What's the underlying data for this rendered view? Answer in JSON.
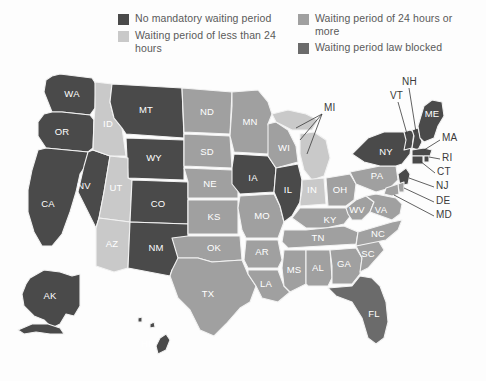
{
  "legend": {
    "columns": [
      {
        "items": [
          {
            "label": "No mandatory waiting period",
            "color": "#4a4a4a",
            "key": "none"
          },
          {
            "label": "Waiting period of less than 24 hours",
            "color": "#c9c9c9",
            "key": "lt24"
          }
        ]
      },
      {
        "items": [
          {
            "label": "Waiting period of 24 hours or more",
            "color": "#a0a0a0",
            "key": "ge24"
          },
          {
            "label": "Waiting period law blocked",
            "color": "#6b6b6b",
            "key": "blocked"
          }
        ]
      }
    ]
  },
  "colors": {
    "none": "#4a4a4a",
    "lt24": "#c9c9c9",
    "ge24": "#a0a0a0",
    "blocked": "#6b6b6b",
    "background": "#fdfdfd",
    "border": "#f2f2f2",
    "inside_label": "#ffffff",
    "outside_label": "#3a3a3a"
  },
  "map": {
    "title": "United States waiting period laws by state",
    "inside_labels": [
      {
        "code": "WA",
        "x": 72,
        "y": 37,
        "category": "none"
      },
      {
        "code": "OR",
        "x": 58,
        "y": 70,
        "category": "none"
      },
      {
        "code": "CA",
        "x": 44,
        "y": 145,
        "category": "none"
      },
      {
        "code": "NV",
        "x": 80,
        "y": 128,
        "category": "none"
      },
      {
        "code": "ID",
        "x": 100,
        "y": 85,
        "category": "lt24"
      },
      {
        "code": "MT",
        "x": 148,
        "y": 52,
        "category": "none"
      },
      {
        "code": "WY",
        "x": 153,
        "y": 98,
        "category": "none"
      },
      {
        "code": "UT",
        "x": 114,
        "y": 128,
        "category": "lt24"
      },
      {
        "code": "AZ",
        "x": 112,
        "y": 184,
        "category": "lt24"
      },
      {
        "code": "CO",
        "x": 158,
        "y": 145,
        "category": "none"
      },
      {
        "code": "NM",
        "x": 152,
        "y": 196,
        "category": "none"
      },
      {
        "code": "ND",
        "x": 207,
        "y": 57,
        "category": "ge24"
      },
      {
        "code": "SD",
        "x": 207,
        "y": 90,
        "category": "ge24"
      },
      {
        "code": "NE",
        "x": 210,
        "y": 123,
        "category": "ge24"
      },
      {
        "code": "KS",
        "x": 214,
        "y": 155,
        "category": "ge24"
      },
      {
        "code": "OK",
        "x": 218,
        "y": 186,
        "category": "ge24"
      },
      {
        "code": "TX",
        "x": 208,
        "y": 234,
        "category": "ge24"
      },
      {
        "code": "MN",
        "x": 250,
        "y": 65,
        "category": "ge24"
      },
      {
        "code": "IA",
        "x": 251,
        "y": 118,
        "category": "none"
      },
      {
        "code": "MO",
        "x": 262,
        "y": 152,
        "category": "ge24"
      },
      {
        "code": "AR",
        "x": 262,
        "y": 187,
        "category": "ge24"
      },
      {
        "code": "LA",
        "x": 268,
        "y": 225,
        "category": "ge24"
      },
      {
        "code": "WI",
        "x": 283,
        "y": 84,
        "category": "ge24"
      },
      {
        "code": "IL",
        "x": 287,
        "y": 128,
        "category": "none"
      },
      {
        "code": "MS",
        "x": 294,
        "y": 208,
        "category": "ge24"
      },
      {
        "code": "IN",
        "x": 312,
        "y": 126,
        "category": "lt24"
      },
      {
        "code": "KY",
        "x": 329,
        "y": 155,
        "category": "ge24"
      },
      {
        "code": "TN",
        "x": 318,
        "y": 178,
        "category": "ge24"
      },
      {
        "code": "AL",
        "x": 317,
        "y": 210,
        "category": "ge24"
      },
      {
        "code": "GA",
        "x": 344,
        "y": 205,
        "category": "ge24"
      },
      {
        "code": "OH",
        "x": 339,
        "y": 123,
        "category": "ge24"
      },
      {
        "code": "WV",
        "x": 355,
        "y": 145,
        "category": "ge24"
      },
      {
        "code": "VA",
        "x": 377,
        "y": 150,
        "category": "ge24"
      },
      {
        "code": "NC",
        "x": 376,
        "y": 177,
        "category": "ge24"
      },
      {
        "code": "SC",
        "x": 368,
        "y": 196,
        "category": "ge24"
      },
      {
        "code": "PA",
        "x": 379,
        "y": 114,
        "category": "ge24"
      },
      {
        "code": "NY",
        "x": 391,
        "y": 89,
        "category": "none"
      },
      {
        "code": "ME",
        "x": 434,
        "y": 52,
        "category": "none"
      },
      {
        "code": "FL",
        "x": 372,
        "y": 250,
        "category": "blocked"
      },
      {
        "code": "AK",
        "x": 49,
        "y": 245,
        "category": "none"
      },
      {
        "code": "HI",
        "x": 148,
        "y": 280,
        "category": "none"
      }
    ],
    "callout_labels": [
      {
        "code": "MI",
        "x": 326,
        "y": 47,
        "category": "lt24",
        "leaders": [
          [
            322,
            52,
            296,
            66
          ],
          [
            322,
            52,
            300,
            78
          ],
          [
            322,
            52,
            307,
            92
          ]
        ]
      },
      {
        "code": "NH",
        "x": 404,
        "y": 20,
        "category": "none",
        "leaders": [
          [
            409,
            25,
            413,
            70
          ]
        ]
      },
      {
        "code": "VT",
        "x": 392,
        "y": 34,
        "category": "none",
        "leaders": [
          [
            398,
            39,
            406,
            72
          ]
        ]
      },
      {
        "code": "MA",
        "x": 443,
        "y": 75,
        "category": "none",
        "leaders": [
          [
            441,
            78,
            418,
            88
          ]
        ]
      },
      {
        "code": "RI",
        "x": 443,
        "y": 95,
        "category": "none",
        "leaders": [
          [
            441,
            97,
            419,
            92
          ]
        ]
      },
      {
        "code": "CT",
        "x": 438,
        "y": 110,
        "category": "none",
        "leaders": [
          [
            436,
            111,
            414,
            96
          ]
        ]
      },
      {
        "code": "NJ",
        "x": 437,
        "y": 124,
        "category": "none",
        "leaders": [
          [
            435,
            125,
            409,
            108
          ]
        ]
      },
      {
        "code": "DE",
        "x": 437,
        "y": 139,
        "category": "ge24",
        "leaders": [
          [
            435,
            140,
            405,
            122
          ]
        ]
      },
      {
        "code": "MD",
        "x": 437,
        "y": 153,
        "category": "ge24",
        "leaders": [
          [
            435,
            153,
            400,
            128
          ]
        ]
      }
    ]
  },
  "categories_by_state": {
    "none": [
      "WA",
      "OR",
      "CA",
      "NV",
      "MT",
      "WY",
      "CO",
      "NM",
      "IA",
      "IL",
      "NY",
      "ME",
      "VT",
      "NH",
      "MA",
      "RI",
      "CT",
      "NJ",
      "AK",
      "HI"
    ],
    "lt24": [
      "ID",
      "UT",
      "AZ",
      "MI",
      "IN"
    ],
    "ge24": [
      "ND",
      "SD",
      "NE",
      "KS",
      "OK",
      "TX",
      "MN",
      "WI",
      "MO",
      "AR",
      "LA",
      "MS",
      "AL",
      "GA",
      "TN",
      "KY",
      "OH",
      "WV",
      "VA",
      "NC",
      "SC",
      "PA",
      "DE",
      "MD"
    ],
    "blocked": [
      "FL"
    ]
  }
}
